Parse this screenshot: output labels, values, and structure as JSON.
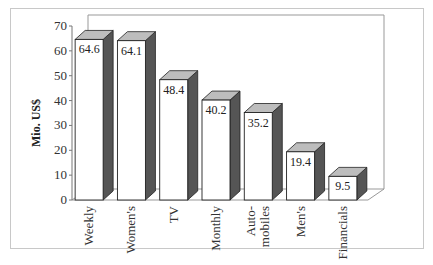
{
  "chart_data": {
    "type": "bar",
    "title": "",
    "xlabel": "",
    "ylabel": "Mio. US$",
    "ylim": [
      0,
      70
    ],
    "yticks": [
      0,
      10,
      20,
      30,
      40,
      50,
      60,
      70
    ],
    "grid": false,
    "style": "3d-column",
    "categories": [
      "Weekly",
      "Women's",
      "TV",
      "Monthly",
      "Auto-mobiles",
      "Men's",
      "Financials"
    ],
    "category_display": [
      [
        "Weekly"
      ],
      [
        "Women's"
      ],
      [
        "TV"
      ],
      [
        "Monthly"
      ],
      [
        "Auto-",
        "mobiles"
      ],
      [
        "Men's"
      ],
      [
        "Financials"
      ]
    ],
    "values": [
      64.6,
      64.1,
      48.4,
      40.2,
      35.2,
      19.4,
      9.5
    ],
    "value_labels": [
      "64.6",
      "64.1",
      "48.4",
      "40.2",
      "35.2",
      "19.4",
      "9.5"
    ],
    "colors": {
      "front": "#ffffff",
      "side": "#555555",
      "top": "#bdbdbd",
      "frame": "#c8c8c8",
      "axis": "#777777"
    }
  }
}
